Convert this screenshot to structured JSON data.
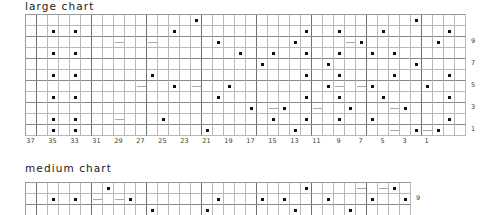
{
  "page": {
    "background": "#ffffff",
    "grid_line_color": "#b9b9b9",
    "grid_major_color": "#707070",
    "dot_color": "#111111"
  },
  "charts": [
    {
      "id": "large-chart",
      "title": "large chart",
      "title_x": 25,
      "title_y": 0,
      "grid_x": 25,
      "grid_y": 14,
      "cell": 11,
      "cols": 40,
      "rows": 11,
      "major_col_every": 5,
      "major_row_every": 2,
      "col_labels": [
        "37",
        "35",
        "33",
        "31",
        "29",
        "27",
        "25",
        "23",
        "21",
        "19",
        "17",
        "15",
        "13",
        "11",
        "9",
        "7",
        "5",
        "3",
        "1"
      ],
      "col_label_cols": [
        0,
        2,
        4,
        6,
        8,
        10,
        12,
        14,
        16,
        18,
        20,
        22,
        24,
        26,
        28,
        30,
        32,
        34,
        36
      ],
      "row_labels": [
        "9",
        "7",
        "5",
        "3",
        "1"
      ],
      "row_label_rows": [
        2,
        4,
        6,
        8,
        10
      ],
      "dots": [
        [
          0,
          15
        ],
        [
          0,
          35
        ],
        [
          1,
          2
        ],
        [
          1,
          4
        ],
        [
          1,
          13
        ],
        [
          1,
          25
        ],
        [
          1,
          28
        ],
        [
          1,
          32
        ],
        [
          1,
          38
        ],
        [
          2,
          17
        ],
        [
          2,
          24
        ],
        [
          2,
          30
        ],
        [
          2,
          37
        ],
        [
          3,
          2
        ],
        [
          3,
          4
        ],
        [
          3,
          19
        ],
        [
          3,
          22
        ],
        [
          3,
          25
        ],
        [
          3,
          28
        ],
        [
          3,
          31
        ],
        [
          3,
          33
        ],
        [
          4,
          21
        ],
        [
          4,
          27
        ],
        [
          4,
          35
        ],
        [
          5,
          2
        ],
        [
          5,
          4
        ],
        [
          5,
          11
        ],
        [
          5,
          25
        ],
        [
          5,
          28
        ],
        [
          5,
          33
        ],
        [
          5,
          38
        ],
        [
          6,
          13
        ],
        [
          6,
          18
        ],
        [
          6,
          27
        ],
        [
          6,
          31
        ],
        [
          6,
          36
        ],
        [
          7,
          2
        ],
        [
          7,
          4
        ],
        [
          7,
          17
        ],
        [
          7,
          25
        ],
        [
          7,
          28
        ],
        [
          7,
          32
        ],
        [
          7,
          38
        ],
        [
          8,
          20
        ],
        [
          8,
          23
        ],
        [
          8,
          29
        ],
        [
          8,
          34
        ],
        [
          9,
          2
        ],
        [
          9,
          4
        ],
        [
          9,
          12
        ],
        [
          9,
          22
        ],
        [
          9,
          25
        ],
        [
          9,
          28
        ],
        [
          9,
          31
        ],
        [
          9,
          38
        ],
        [
          10,
          2
        ],
        [
          10,
          4
        ],
        [
          10,
          16
        ],
        [
          10,
          24
        ],
        [
          10,
          35
        ],
        [
          10,
          37
        ]
      ],
      "dashes": [
        [
          2,
          8
        ],
        [
          2,
          11
        ],
        [
          2,
          29
        ],
        [
          6,
          10
        ],
        [
          6,
          15
        ],
        [
          6,
          28
        ],
        [
          6,
          30
        ],
        [
          8,
          22
        ],
        [
          8,
          26
        ],
        [
          8,
          33
        ],
        [
          9,
          8
        ],
        [
          10,
          33
        ],
        [
          10,
          36
        ]
      ]
    },
    {
      "id": "medium-chart",
      "title": "medium chart",
      "title_x": 25,
      "title_y": 162,
      "grid_x": 25,
      "grid_y": 182,
      "cell": 11,
      "cols": 35,
      "rows": 3,
      "major_col_every": 5,
      "major_row_every": 2,
      "col_labels": [],
      "col_label_cols": [],
      "row_labels": [
        "9"
      ],
      "row_label_rows": [
        1
      ],
      "dots": [
        [
          0,
          7
        ],
        [
          0,
          25
        ],
        [
          0,
          33
        ],
        [
          1,
          2
        ],
        [
          1,
          4
        ],
        [
          1,
          9
        ],
        [
          1,
          17
        ],
        [
          1,
          21
        ],
        [
          1,
          23
        ],
        [
          1,
          27
        ],
        [
          1,
          31
        ],
        [
          1,
          34
        ],
        [
          2,
          11
        ],
        [
          2,
          16
        ],
        [
          2,
          24
        ],
        [
          2,
          29
        ]
      ],
      "dashes": [
        [
          1,
          6
        ],
        [
          1,
          8
        ],
        [
          0,
          30
        ],
        [
          0,
          32
        ]
      ]
    }
  ]
}
